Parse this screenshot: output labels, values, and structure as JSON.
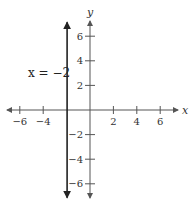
{
  "chart_data": {
    "type": "line",
    "title": "",
    "xlabel": "x",
    "ylabel": "y",
    "xlim": [
      -7.5,
      8
    ],
    "ylim": [
      -7.5,
      7.5
    ],
    "x_ticks": [
      -6,
      -4,
      2,
      4,
      6
    ],
    "y_ticks": [
      6,
      4,
      2,
      -2,
      -4,
      -6
    ],
    "x_tick_labels": [
      "−6",
      "−4",
      "2",
      "4",
      "6"
    ],
    "y_tick_labels": [
      "6",
      "4",
      "2",
      "−2",
      "−4",
      "−6"
    ],
    "grid": false,
    "series": [
      {
        "name": "x = −2",
        "kind": "vertical_line",
        "x": -2,
        "y_range": [
          -6.8,
          6.8
        ],
        "arrows": "both",
        "annotation": "x = −2"
      }
    ]
  },
  "layout": {
    "origin_px": [
      90,
      110
    ],
    "unit_px_x": 11.7,
    "unit_px_y": 12.3,
    "axis_color": "#555555",
    "line_color": "#222222"
  }
}
